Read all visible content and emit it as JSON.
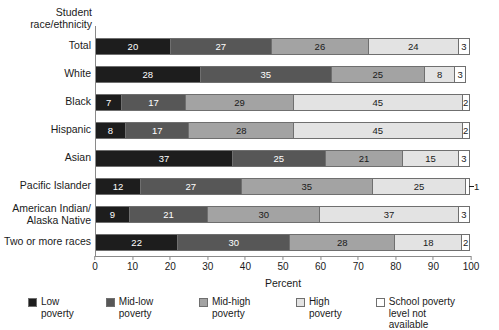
{
  "chart_data": {
    "type": "bar",
    "orientation": "horizontal",
    "stacked": true,
    "title": "",
    "xlabel": "Percent",
    "ylabel": "Student\nrace/ethnicity",
    "ylabel_lines": [
      "Student",
      "race/ethnicity"
    ],
    "xlim": [
      0,
      100
    ],
    "xticks": [
      0,
      10,
      20,
      30,
      40,
      50,
      60,
      70,
      80,
      90,
      100
    ],
    "xticklabels": [
      "0",
      "10",
      "20",
      "30",
      "40",
      "50",
      "60",
      "70",
      "80",
      "90",
      "100"
    ],
    "grid": false,
    "legend_position": "bottom",
    "categories": [
      "Total",
      "White",
      "Black",
      "Hispanic",
      "Asian",
      "Pacific Islander",
      "American Indian/\nAlaska Native",
      "Two or more races"
    ],
    "series": [
      {
        "name": "Low poverty",
        "color": "#1d1d1d",
        "values": [
          20,
          28,
          7,
          8,
          37,
          12,
          9,
          22
        ]
      },
      {
        "name": "Mid-low poverty",
        "color": "#575757",
        "values": [
          27,
          35,
          17,
          17,
          25,
          27,
          21,
          30
        ]
      },
      {
        "name": "Mid-high poverty",
        "color": "#a3a3a3",
        "values": [
          26,
          25,
          29,
          28,
          21,
          35,
          30,
          28
        ]
      },
      {
        "name": "High poverty",
        "color": "#e3e3e3",
        "values": [
          24,
          8,
          45,
          45,
          15,
          25,
          37,
          18
        ]
      },
      {
        "name": "School poverty\nlevel not available",
        "color": "#ffffff",
        "values": [
          3,
          3,
          2,
          2,
          3,
          1,
          3,
          2
        ]
      }
    ],
    "rows": [
      {
        "category": "Total",
        "segments": [
          {
            "series": "Low poverty",
            "value": 20,
            "label": "20",
            "label_outside": false
          },
          {
            "series": "Mid-low poverty",
            "value": 27,
            "label": "27",
            "label_outside": false
          },
          {
            "series": "Mid-high poverty",
            "value": 26,
            "label": "26",
            "label_outside": false
          },
          {
            "series": "High poverty",
            "value": 24,
            "label": "24",
            "label_outside": false
          },
          {
            "series": "School poverty level not available",
            "value": 3,
            "label": "3",
            "label_outside": false
          }
        ]
      },
      {
        "category": "White",
        "segments": [
          {
            "series": "Low poverty",
            "value": 28,
            "label": "28",
            "label_outside": false
          },
          {
            "series": "Mid-low poverty",
            "value": 35,
            "label": "35",
            "label_outside": false
          },
          {
            "series": "Mid-high poverty",
            "value": 25,
            "label": "25",
            "label_outside": false
          },
          {
            "series": "High poverty",
            "value": 8,
            "label": "8",
            "label_outside": false
          },
          {
            "series": "School poverty level not available",
            "value": 3,
            "label": "3",
            "label_outside": false
          }
        ]
      },
      {
        "category": "Black",
        "segments": [
          {
            "series": "Low poverty",
            "value": 7,
            "label": "7",
            "label_outside": false
          },
          {
            "series": "Mid-low poverty",
            "value": 17,
            "label": "17",
            "label_outside": false
          },
          {
            "series": "Mid-high poverty",
            "value": 29,
            "label": "29",
            "label_outside": false
          },
          {
            "series": "High poverty",
            "value": 45,
            "label": "45",
            "label_outside": false
          },
          {
            "series": "School poverty level not available",
            "value": 2,
            "label": "2",
            "label_outside": false
          }
        ]
      },
      {
        "category": "Hispanic",
        "segments": [
          {
            "series": "Low poverty",
            "value": 8,
            "label": "8",
            "label_outside": false
          },
          {
            "series": "Mid-low poverty",
            "value": 17,
            "label": "17",
            "label_outside": false
          },
          {
            "series": "Mid-high poverty",
            "value": 28,
            "label": "28",
            "label_outside": false
          },
          {
            "series": "High poverty",
            "value": 45,
            "label": "45",
            "label_outside": false
          },
          {
            "series": "School poverty level not available",
            "value": 2,
            "label": "2",
            "label_outside": false
          }
        ]
      },
      {
        "category": "Asian",
        "segments": [
          {
            "series": "Low poverty",
            "value": 37,
            "label": "37",
            "label_outside": false
          },
          {
            "series": "Mid-low poverty",
            "value": 25,
            "label": "25",
            "label_outside": false
          },
          {
            "series": "Mid-high poverty",
            "value": 21,
            "label": "21",
            "label_outside": false
          },
          {
            "series": "High poverty",
            "value": 15,
            "label": "15",
            "label_outside": false
          },
          {
            "series": "School poverty level not available",
            "value": 3,
            "label": "3",
            "label_outside": false
          }
        ]
      },
      {
        "category": "Pacific Islander",
        "segments": [
          {
            "series": "Low poverty",
            "value": 12,
            "label": "12",
            "label_outside": false
          },
          {
            "series": "Mid-low poverty",
            "value": 27,
            "label": "27",
            "label_outside": false
          },
          {
            "series": "Mid-high poverty",
            "value": 35,
            "label": "35",
            "label_outside": false
          },
          {
            "series": "High poverty",
            "value": 25,
            "label": "25",
            "label_outside": false
          },
          {
            "series": "School poverty level not available",
            "value": 1,
            "label": "1",
            "label_outside": true
          }
        ]
      },
      {
        "category": "American Indian/Alaska Native",
        "segments": [
          {
            "series": "Low poverty",
            "value": 9,
            "label": "9",
            "label_outside": false
          },
          {
            "series": "Mid-low poverty",
            "value": 21,
            "label": "21",
            "label_outside": false
          },
          {
            "series": "Mid-high poverty",
            "value": 30,
            "label": "30",
            "label_outside": false
          },
          {
            "series": "High poverty",
            "value": 37,
            "label": "37",
            "label_outside": false
          },
          {
            "series": "School poverty level not available",
            "value": 3,
            "label": "3",
            "label_outside": false
          }
        ]
      },
      {
        "category": "Two or more races",
        "segments": [
          {
            "series": "Low poverty",
            "value": 22,
            "label": "22",
            "label_outside": false
          },
          {
            "series": "Mid-low poverty",
            "value": 30,
            "label": "30",
            "label_outside": false
          },
          {
            "series": "Mid-high poverty",
            "value": 28,
            "label": "28",
            "label_outside": false
          },
          {
            "series": "High poverty",
            "value": 18,
            "label": "18",
            "label_outside": false
          },
          {
            "series": "School poverty level not available",
            "value": 2,
            "label": "2",
            "label_outside": false
          }
        ]
      }
    ],
    "legend": [
      {
        "label": "Low poverty",
        "color": "#1d1d1d"
      },
      {
        "label": "Mid-low poverty",
        "color": "#575757"
      },
      {
        "label": "Mid-high poverty",
        "color": "#a3a3a3"
      },
      {
        "label": "High poverty",
        "color": "#e3e3e3"
      },
      {
        "label": "School poverty\nlevel not available",
        "color": "#ffffff"
      }
    ]
  }
}
